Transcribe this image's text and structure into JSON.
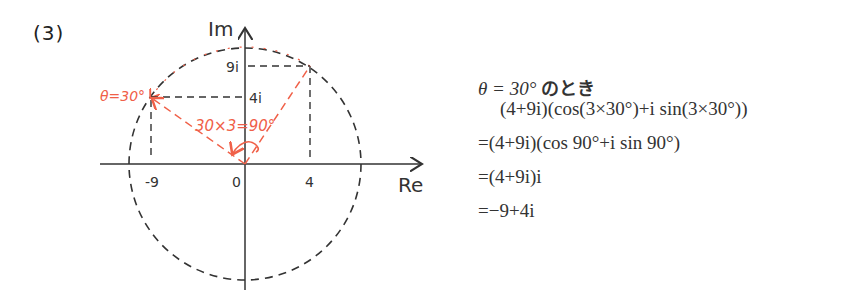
{
  "problem_label": "(3)",
  "diagram": {
    "axis_labels": {
      "imaginary": "Im",
      "real": "Re"
    },
    "tick_labels": {
      "re_neg9": "-9",
      "origin": "0",
      "re_4": "4",
      "im_9i": "9i",
      "im_4i": "4i"
    },
    "annotations": {
      "theta": "θ=30°",
      "rotation": "30×3=90°"
    },
    "colors": {
      "axis": "#333333",
      "dashed": "#333333",
      "accent": "#f06048"
    },
    "points": [
      {
        "name": "4+9i",
        "re": 4,
        "im": 9
      },
      {
        "name": "-9+4i",
        "re": -9,
        "im": 4
      }
    ],
    "circle_radius": "sqrt(97)"
  },
  "work": {
    "heading_math": "θ = 30°",
    "heading_jp": "のとき",
    "line1": "(4+9i)(cos(3×30°)+i sin(3×30°))",
    "line2": "=(4+9i)(cos 90°+i sin 90°)",
    "line3": "=(4+9i)i",
    "line4": "=−9+4i"
  }
}
